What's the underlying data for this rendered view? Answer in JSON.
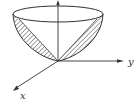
{
  "figure": {
    "axes": {
      "x_label": "x",
      "y_label": "y",
      "z_label": ""
    },
    "colors": {
      "stroke": "#333333",
      "background": "#ffffff"
    }
  }
}
